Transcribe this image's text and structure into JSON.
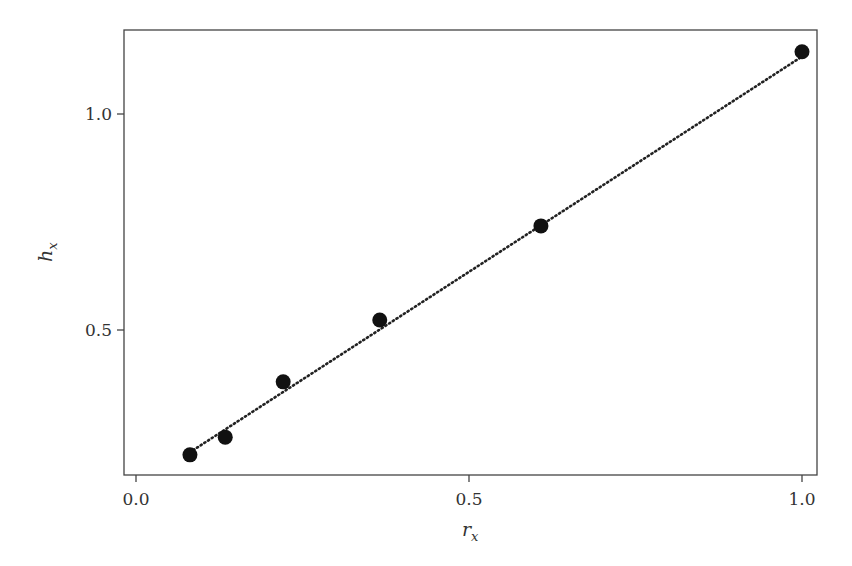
{
  "chart_data": {
    "type": "scatter",
    "title": "",
    "xlabel": "r_x",
    "ylabel": "h_x",
    "xlabel_main": "r",
    "xlabel_sub": "x",
    "ylabel_main": "h",
    "ylabel_sub": "x",
    "xlim": [
      -0.02,
      1.02
    ],
    "ylim": [
      0.18,
      1.21
    ],
    "x_ticks": [
      0.0,
      0.5,
      1.0
    ],
    "x_tick_labels": [
      "0.0",
      "0.5",
      "1.0"
    ],
    "y_ticks": [
      0.5,
      1.0
    ],
    "y_tick_labels": [
      "0.5",
      "1.0"
    ],
    "grid": false,
    "legend": null,
    "series": [
      {
        "name": "observed",
        "kind": "scatter",
        "marker": "filled-circle",
        "color": "#111111",
        "points": [
          {
            "x": 0.081,
            "y": 0.211
          },
          {
            "x": 0.134,
            "y": 0.252
          },
          {
            "x": 0.221,
            "y": 0.38
          },
          {
            "x": 0.366,
            "y": 0.523
          },
          {
            "x": 0.608,
            "y": 0.741
          },
          {
            "x": 1.0,
            "y": 1.144
          }
        ]
      },
      {
        "name": "fit",
        "kind": "line",
        "style": "dotted",
        "color": "#222222",
        "points": [
          {
            "x": 0.086,
            "y": 0.222
          },
          {
            "x": 1.0,
            "y": 1.133
          }
        ]
      }
    ]
  }
}
